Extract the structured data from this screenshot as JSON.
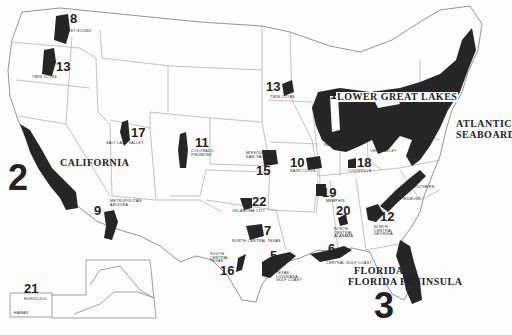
{
  "map": {
    "title": "",
    "colors": {
      "region_fill": "#262626",
      "state_lines": "#8a8a8a",
      "background": "#fdfdfd",
      "text": "#222222"
    },
    "regions": [
      {
        "rank": "1",
        "name": "LOWER GREAT LAKES"
      },
      {
        "rank": "1",
        "name": "ATLANTIC SEABOARD"
      },
      {
        "rank": "2",
        "name": "CALIFORNIA"
      },
      {
        "rank": "3",
        "name": "FLORIDA PENINSULA"
      },
      {
        "rank": "5",
        "name": "TEXAS-LOUISIANA GULF COAST"
      },
      {
        "rank": "6",
        "name": "CENTRAL GULF COAST"
      },
      {
        "rank": "7",
        "name": "NORTH CENTRAL TEXAS"
      },
      {
        "rank": "8",
        "name": "PUGET SOUND"
      },
      {
        "rank": "9",
        "name": "METROPOLITAN ARIZONA"
      },
      {
        "rank": "10",
        "name": "SAINT LOUIS"
      },
      {
        "rank": "11",
        "name": "COLORADO PIEDMONT"
      },
      {
        "rank": "12",
        "name": "NORTH CENTRAL GEORGIA"
      },
      {
        "rank": "13",
        "name": "TWIN CITIES"
      },
      {
        "rank": "14",
        "name": "WILLAMETTE VALLEY"
      },
      {
        "rank": "15",
        "name": "MISSOURI-KAW VALLEY"
      },
      {
        "rank": "16",
        "name": "SOUTH CENTRAL TEXAS"
      },
      {
        "rank": "17",
        "name": "SALT LAKE VALLEY"
      },
      {
        "rank": "18",
        "name": "LOUISVILLE"
      },
      {
        "rank": "19",
        "name": "MEMPHIS"
      },
      {
        "rank": "20",
        "name": "NORTH CENTRAL ALABAMA"
      },
      {
        "rank": "21",
        "name": "HONOLULU"
      },
      {
        "rank": "22",
        "name": "OKLAHOMA CITY"
      }
    ],
    "minor_labels": {
      "central_indiana": "CENTRAL INDIANA",
      "ohio_valley": "OHIO VALLEY",
      "southern": "SOUTHERN",
      "piedmont": "PIEDMONT",
      "hawaii": "HAWAII"
    }
  }
}
